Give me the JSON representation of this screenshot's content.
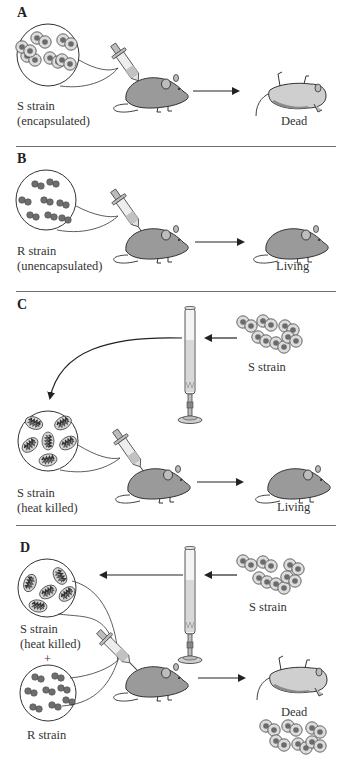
{
  "figure": {
    "panels": [
      {
        "id": "A",
        "letter": "A",
        "inoculum_label_line1": "S strain",
        "inoculum_label_line2": "(encapsulated)",
        "outcome": "Dead"
      },
      {
        "id": "B",
        "letter": "B",
        "inoculum_label_line1": "R strain",
        "inoculum_label_line2": "(unencapsulated)",
        "outcome": "Living"
      },
      {
        "id": "C",
        "letter": "C",
        "source_label": "S strain",
        "inoculum_label_line1": "S strain",
        "inoculum_label_line2": "(heat killed)",
        "outcome": "Living"
      },
      {
        "id": "D",
        "letter": "D",
        "source_label": "S strain",
        "inoculum_label_line1": "S strain",
        "inoculum_label_line2": "(heat killed)",
        "plus": "+",
        "second_inoculum_label": "R strain",
        "outcome": "Dead"
      }
    ],
    "colors": {
      "cell_capsule": "#d9d9d9",
      "cell_core": "#6b6b6b",
      "r_cell": "#6e6e6e",
      "mouse_body": "#9a9a9a",
      "dead_mouse_body": "#c8c8c8",
      "outline": "#333333",
      "divider": "#6e6e6e"
    }
  }
}
